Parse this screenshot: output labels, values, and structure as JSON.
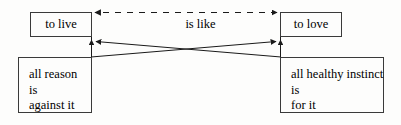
{
  "diagram": {
    "type": "concept-diagram",
    "canvas": {
      "width": 401,
      "height": 125
    },
    "colors": {
      "stroke": "#3a3a3a",
      "edge": "#1a1a1a",
      "text": "#000000",
      "background": "#fdfdfc"
    },
    "nodes": [
      {
        "id": "to-live",
        "label": "to live",
        "lines": [
          "to live"
        ],
        "x": 30,
        "y": 12,
        "width": 62,
        "height": 25
      },
      {
        "id": "to-love",
        "label": "to love",
        "lines": [
          "to love"
        ],
        "x": 280,
        "y": 12,
        "width": 62,
        "height": 25
      },
      {
        "id": "all-reason",
        "label": "all reason is against it",
        "lines": [
          "all reason",
          "is",
          "against it"
        ],
        "x": 18,
        "y": 57,
        "width": 74,
        "height": 56
      },
      {
        "id": "all-healthy-instinct",
        "label": "all healthy instinct is for it",
        "lines": [
          "all healthy instinct",
          "is",
          "for it"
        ],
        "x": 280,
        "y": 57,
        "width": 104,
        "height": 56
      }
    ],
    "edges": [
      {
        "id": "is-like",
        "label": "is like",
        "from": "to-live",
        "to": "to-love",
        "style": "dashed",
        "arrowheads": "both"
      },
      {
        "id": "reason-to-love",
        "label": "",
        "from": "all-reason",
        "to": "to-love",
        "style": "solid",
        "arrowheads": "end"
      },
      {
        "id": "instinct-to-live",
        "label": "",
        "from": "all-healthy-instinct",
        "to": "to-live",
        "style": "solid",
        "arrowheads": "end"
      }
    ],
    "edge_labels": {
      "is_like": "is like"
    },
    "bleed_through": {
      "line_top": "",
      "line_upper_mid": "",
      "line_mid": "",
      "line_lower": "",
      "line_bottom": ""
    }
  }
}
